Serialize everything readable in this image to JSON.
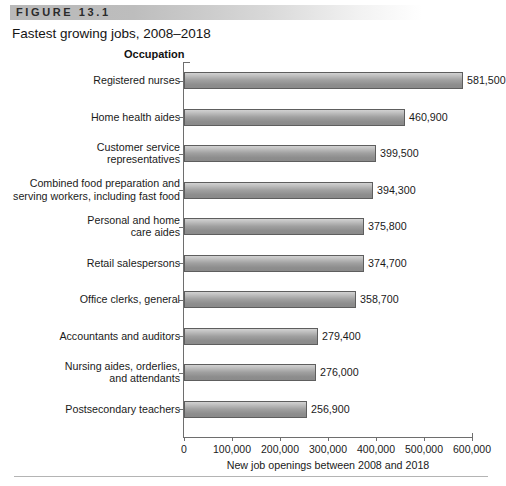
{
  "figure": {
    "band_label": "FIGURE 13.1",
    "title": "Fastest growing jobs, 2008–2018"
  },
  "axis_header": "Occupation",
  "colors": {
    "band_start": "#b9b9b9",
    "band_end": "#ffffff",
    "bar_light": "#d2d2d2",
    "bar_dark": "#8a8a8a",
    "bar_border": "#5e5e5e",
    "axis": "#6e6e6e",
    "text": "#1a1a1a"
  },
  "chart_data": {
    "type": "bar",
    "orientation": "horizontal",
    "title": "Fastest growing jobs, 2008–2018",
    "xlabel": "New job openings  between 2008 and 2018",
    "ylabel": "Occupation",
    "xlim": [
      0,
      600000
    ],
    "grid": false,
    "legend": false,
    "xticks": [
      0,
      100000,
      200000,
      300000,
      400000,
      500000,
      600000
    ],
    "xtick_labels": [
      "0",
      "100,000",
      "200,000",
      "300,000",
      "400,000",
      "500,000",
      "600,000"
    ],
    "categories": [
      "Registered nurses",
      "Home health aides",
      "Customer service representatives",
      "Combined food preparation and serving workers, including fast food",
      "Personal and home care aides",
      "Retail salespersons",
      "Office clerks, general",
      "Accountants and auditors",
      "Nursing aides, orderlies, and attendants",
      "Postsecondary teachers"
    ],
    "category_lines": [
      [
        "Registered nurses"
      ],
      [
        "Home health aides"
      ],
      [
        "Customer service",
        "representatives"
      ],
      [
        "Combined food preparation and",
        "serving workers, including fast food"
      ],
      [
        "Personal and home",
        "care aides"
      ],
      [
        "Retail salespersons"
      ],
      [
        "Office clerks, general"
      ],
      [
        "Accountants and auditors"
      ],
      [
        "Nursing aides, orderlies,",
        "and attendants"
      ],
      [
        "Postsecondary teachers"
      ]
    ],
    "values": [
      581500,
      460900,
      399500,
      394300,
      375800,
      374700,
      358700,
      279400,
      276000,
      256900
    ],
    "value_labels": [
      "581,500",
      "460,900",
      "399,500",
      "394,300",
      "375,800",
      "374,700",
      "358,700",
      "279,400",
      "276,000",
      "256,900"
    ]
  }
}
